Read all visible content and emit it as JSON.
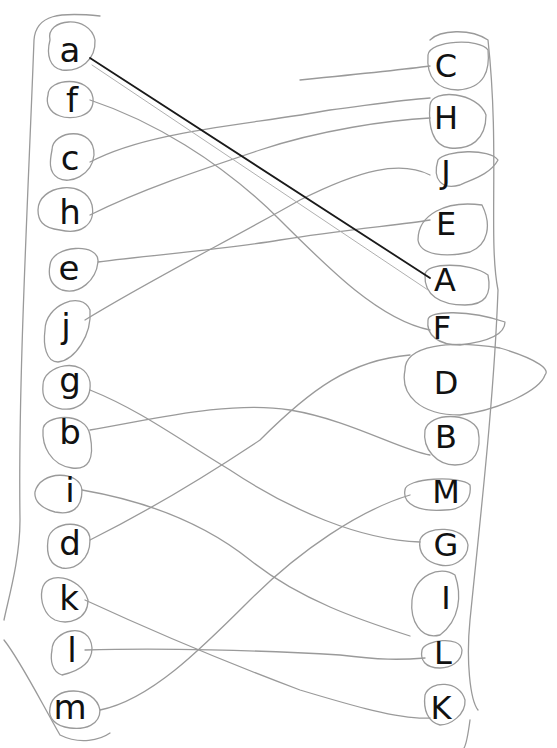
{
  "worksheet": {
    "type": "letter-matching",
    "left_column": {
      "label": "lowercase letters",
      "items": [
        {
          "letter": "a",
          "x": 70,
          "y": 50
        },
        {
          "letter": "f",
          "x": 72,
          "y": 100
        },
        {
          "letter": "c",
          "x": 70,
          "y": 160
        },
        {
          "letter": "h",
          "x": 70,
          "y": 212
        },
        {
          "letter": "e",
          "x": 69,
          "y": 269
        },
        {
          "letter": "j",
          "x": 66,
          "y": 326
        },
        {
          "letter": "g",
          "x": 70,
          "y": 380
        },
        {
          "letter": "b",
          "x": 70,
          "y": 432
        },
        {
          "letter": "i",
          "x": 70,
          "y": 490
        },
        {
          "letter": "d",
          "x": 70,
          "y": 543
        },
        {
          "letter": "k",
          "x": 69,
          "y": 598
        },
        {
          "letter": "l",
          "x": 72,
          "y": 650
        },
        {
          "letter": "m",
          "x": 70,
          "y": 707
        }
      ]
    },
    "right_column": {
      "label": "uppercase letters",
      "items": [
        {
          "letter": "C",
          "x": 446,
          "y": 66
        },
        {
          "letter": "H",
          "x": 446,
          "y": 118
        },
        {
          "letter": "J",
          "x": 446,
          "y": 172
        },
        {
          "letter": "E",
          "x": 446,
          "y": 224
        },
        {
          "letter": "A",
          "x": 445,
          "y": 280
        },
        {
          "letter": "F",
          "x": 442,
          "y": 328
        },
        {
          "letter": "D",
          "x": 446,
          "y": 383
        },
        {
          "letter": "B",
          "x": 446,
          "y": 437
        },
        {
          "letter": "M",
          "x": 446,
          "y": 492
        },
        {
          "letter": "G",
          "x": 446,
          "y": 545
        },
        {
          "letter": "I",
          "x": 446,
          "y": 598
        },
        {
          "letter": "L",
          "x": 443,
          "y": 653
        },
        {
          "letter": "K",
          "x": 441,
          "y": 708
        }
      ]
    },
    "matches": [
      {
        "from": "a",
        "to": "A",
        "style": "dark"
      },
      {
        "from": "f",
        "to": "F",
        "style": "pencil"
      },
      {
        "from": "c",
        "to": "H",
        "style": "pencil"
      },
      {
        "from": "h",
        "to": "J",
        "style": "pencil"
      },
      {
        "from": "e",
        "to": "E",
        "style": "pencil"
      },
      {
        "from": "j",
        "to": "C",
        "style": "pencil"
      },
      {
        "from": "g",
        "to": "G",
        "style": "pencil"
      },
      {
        "from": "b",
        "to": "B",
        "style": "pencil"
      },
      {
        "from": "i",
        "to": "I",
        "style": "pencil"
      },
      {
        "from": "d",
        "to": "D",
        "style": "pencil"
      },
      {
        "from": "k",
        "to": "K",
        "style": "pencil"
      },
      {
        "from": "l",
        "to": "L",
        "style": "pencil"
      },
      {
        "from": "m",
        "to": "M",
        "style": "pencil"
      }
    ],
    "colors": {
      "paper": "#ffffff",
      "ink": "#111111",
      "pencil": "#8a8a8a",
      "dark_line": "#1a1a1a"
    }
  }
}
